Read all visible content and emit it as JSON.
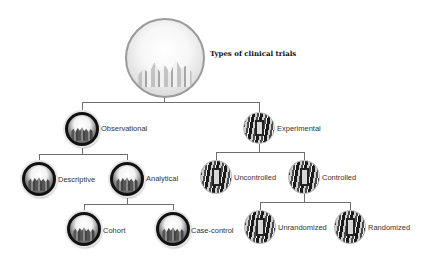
{
  "diagram": {
    "title": "Types of clinical trials",
    "root": {
      "label": "Types of clinical trials",
      "icon": "lab-glassware-icon"
    },
    "nodes": {
      "observational": {
        "label": "Observational",
        "icon": "crowd-icon"
      },
      "experimental": {
        "label": "Experimental",
        "icon": "person-icon"
      },
      "descriptive": {
        "label": "Descriptive",
        "icon": "crowd-icon"
      },
      "analytical": {
        "label": "Analytical",
        "icon": "crowd-icon"
      },
      "cohort": {
        "label": "Cohort",
        "icon": "crowd-icon"
      },
      "case_control": {
        "label": "Case-control",
        "icon": "crowd-icon"
      },
      "uncontrolled": {
        "label": "Uncontrolled",
        "icon": "person-icon"
      },
      "controlled": {
        "label": "Controlled",
        "icon": "person-icon"
      },
      "unrandomized": {
        "label": "Unrandomized",
        "icon": "person-icon"
      },
      "randomized": {
        "label": "Randomized",
        "icon": "person-icon"
      }
    },
    "edges": [
      [
        "root",
        "observational"
      ],
      [
        "root",
        "experimental"
      ],
      [
        "observational",
        "descriptive"
      ],
      [
        "observational",
        "analytical"
      ],
      [
        "analytical",
        "cohort"
      ],
      [
        "analytical",
        "case_control"
      ],
      [
        "experimental",
        "uncontrolled"
      ],
      [
        "experimental",
        "controlled"
      ],
      [
        "controlled",
        "unrandomized"
      ],
      [
        "controlled",
        "randomized"
      ]
    ]
  }
}
